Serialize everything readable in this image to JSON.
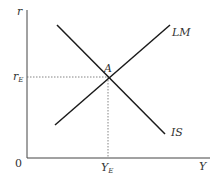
{
  "diagram": {
    "axes": {
      "y_label": "r",
      "x_label": "Y",
      "origin_label": "0"
    },
    "curves": [
      {
        "name": "IS",
        "label": "IS",
        "slope": "downward"
      },
      {
        "name": "LM",
        "label": "LM",
        "slope": "upward"
      }
    ],
    "equilibrium": {
      "point_label": "A",
      "r_label_main": "r",
      "r_label_sub": "E",
      "y_label_main": "Y",
      "y_label_sub": "E"
    },
    "colors": {
      "line": "#1a1a1a",
      "axis": "#444444",
      "guide": "#666666",
      "text": "#333333"
    }
  }
}
